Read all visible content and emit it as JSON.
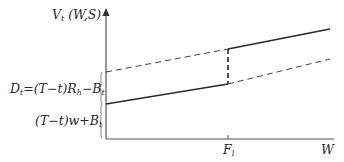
{
  "diagram": {
    "y_axis_label_main": "V",
    "y_axis_label_sub": "t",
    "y_axis_label_args": " (W,S)",
    "x_axis_label": "W",
    "x_tick_label_main": "F",
    "x_tick_label_sub": "l",
    "bracket_upper_label": {
      "D": "D",
      "D_sub": "t",
      "eq": "=(T−t)R",
      "R_sub": "h",
      "minus": "−B",
      "B_sub": "t"
    },
    "bracket_lower_label": {
      "main": "(T−t)w+B",
      "B_sub": "t"
    },
    "lines": [
      {
        "name": "lower-line",
        "segments": [
          {
            "style": "solid",
            "from": [
              106,
              104
            ],
            "to": [
              228,
              84
            ]
          },
          {
            "style": "dashed",
            "from": [
              228,
              84
            ],
            "to": [
              330,
              59
            ]
          }
        ]
      },
      {
        "name": "upper-line",
        "segments": [
          {
            "style": "dashed",
            "from": [
              106,
              72
            ],
            "to": [
              228,
              49
            ]
          },
          {
            "style": "solid",
            "from": [
              228,
              49
            ],
            "to": [
              330,
              29
            ]
          }
        ]
      },
      {
        "name": "jump-line",
        "segments": [
          {
            "style": "dashed",
            "from": [
              228,
              49
            ],
            "to": [
              228,
              84
            ]
          }
        ]
      }
    ],
    "colors": {
      "ink": "#2a2a2a",
      "axis": "#555555",
      "background": "#ffffff"
    }
  }
}
